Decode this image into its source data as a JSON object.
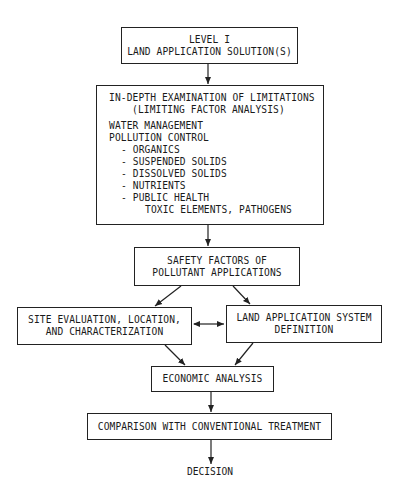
{
  "diagram": {
    "type": "flowchart",
    "nodes": {
      "level": {
        "lines": [
          "LEVEL I",
          "LAND APPLICATION SOLUTION(S)"
        ]
      },
      "examination": {
        "header": [
          "IN-DEPTH EXAMINATION OF LIMITATIONS",
          "(LIMITING FACTOR ANALYSIS)"
        ],
        "items": [
          {
            "text": "WATER MANAGEMENT",
            "indent": 0
          },
          {
            "text": "POLLUTION CONTROL",
            "indent": 0
          },
          {
            "text": "- ORGANICS",
            "indent": 1
          },
          {
            "text": "- SUSPENDED SOLIDS",
            "indent": 1
          },
          {
            "text": "- DISSOLVED SOLIDS",
            "indent": 1
          },
          {
            "text": "- NUTRIENTS",
            "indent": 1
          },
          {
            "text": "- PUBLIC HEALTH",
            "indent": 1
          },
          {
            "text": "TOXIC ELEMENTS, PATHOGENS",
            "indent": 2
          }
        ]
      },
      "safety": {
        "lines": [
          "SAFETY FACTORS OF",
          "POLLUTANT APPLICATIONS"
        ]
      },
      "site": {
        "lines": [
          "SITE EVALUATION, LOCATION,",
          "AND CHARACTERIZATION"
        ]
      },
      "system": {
        "lines": [
          "LAND APPLICATION SYSTEM",
          "DEFINITION"
        ]
      },
      "economic": {
        "lines": [
          "ECONOMIC ANALYSIS"
        ]
      },
      "comparison": {
        "lines": [
          "COMPARISON WITH CONVENTIONAL TREATMENT"
        ]
      },
      "decision": {
        "label": "DECISION"
      }
    },
    "edges": [
      {
        "from": "level",
        "to": "examination",
        "type": "arrow"
      },
      {
        "from": "examination",
        "to": "safety",
        "type": "arrow"
      },
      {
        "from": "safety",
        "to": "site",
        "type": "arrow"
      },
      {
        "from": "safety",
        "to": "system",
        "type": "arrow"
      },
      {
        "from": "site",
        "to": "system",
        "type": "bidirectional-arrow"
      },
      {
        "from": "site",
        "to": "economic",
        "type": "arrow"
      },
      {
        "from": "system",
        "to": "economic",
        "type": "arrow"
      },
      {
        "from": "economic",
        "to": "comparison",
        "type": "arrow"
      },
      {
        "from": "comparison",
        "to": "decision",
        "type": "arrow"
      }
    ]
  },
  "colors": {
    "line": "#222222",
    "background": "#ffffff",
    "text": "#1a1a1a"
  }
}
